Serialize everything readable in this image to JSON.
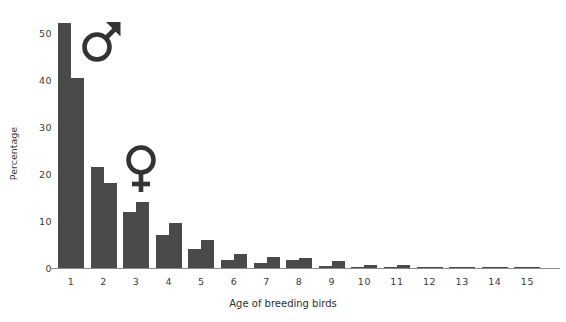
{
  "chart_data": {
    "type": "bar",
    "title": "",
    "xlabel": "Age of breeding birds",
    "ylabel": "Percentage",
    "categories": [
      "1",
      "2",
      "3",
      "4",
      "5",
      "6",
      "7",
      "8",
      "9",
      "10",
      "11",
      "12",
      "13",
      "14",
      "15"
    ],
    "series": [
      {
        "name": "Male",
        "symbol": "mars-symbol",
        "color": "#4a4a4a",
        "values": [
          52.0,
          21.5,
          12.0,
          7.0,
          4.0,
          1.8,
          1.0,
          1.6,
          0.4,
          0.2,
          0.3,
          0.2,
          0.2,
          0.1,
          0.2
        ]
      },
      {
        "name": "Female",
        "symbol": "venus-symbol",
        "color": "#4a4a4a",
        "values": [
          40.3,
          18.0,
          14.0,
          9.5,
          6.0,
          3.0,
          2.4,
          2.2,
          1.5,
          0.7,
          0.6,
          0.3,
          0.2,
          0.2,
          0.2
        ]
      }
    ],
    "yticks": [
      "0",
      "10",
      "20",
      "30",
      "40",
      "50"
    ],
    "ytick_values": [
      0,
      10,
      20,
      30,
      40,
      50
    ],
    "ylim": [
      0,
      54
    ],
    "xlim_categories": 15,
    "grid": false,
    "legend": "gender-symbols-inline",
    "bar_color": "#4a4a4a",
    "axis_color": "#8b8b8b",
    "text_color": "#3a3a3a",
    "background": "#ffffff"
  },
  "annotations": {
    "male_glyph": "♂",
    "female_glyph": "♀"
  }
}
